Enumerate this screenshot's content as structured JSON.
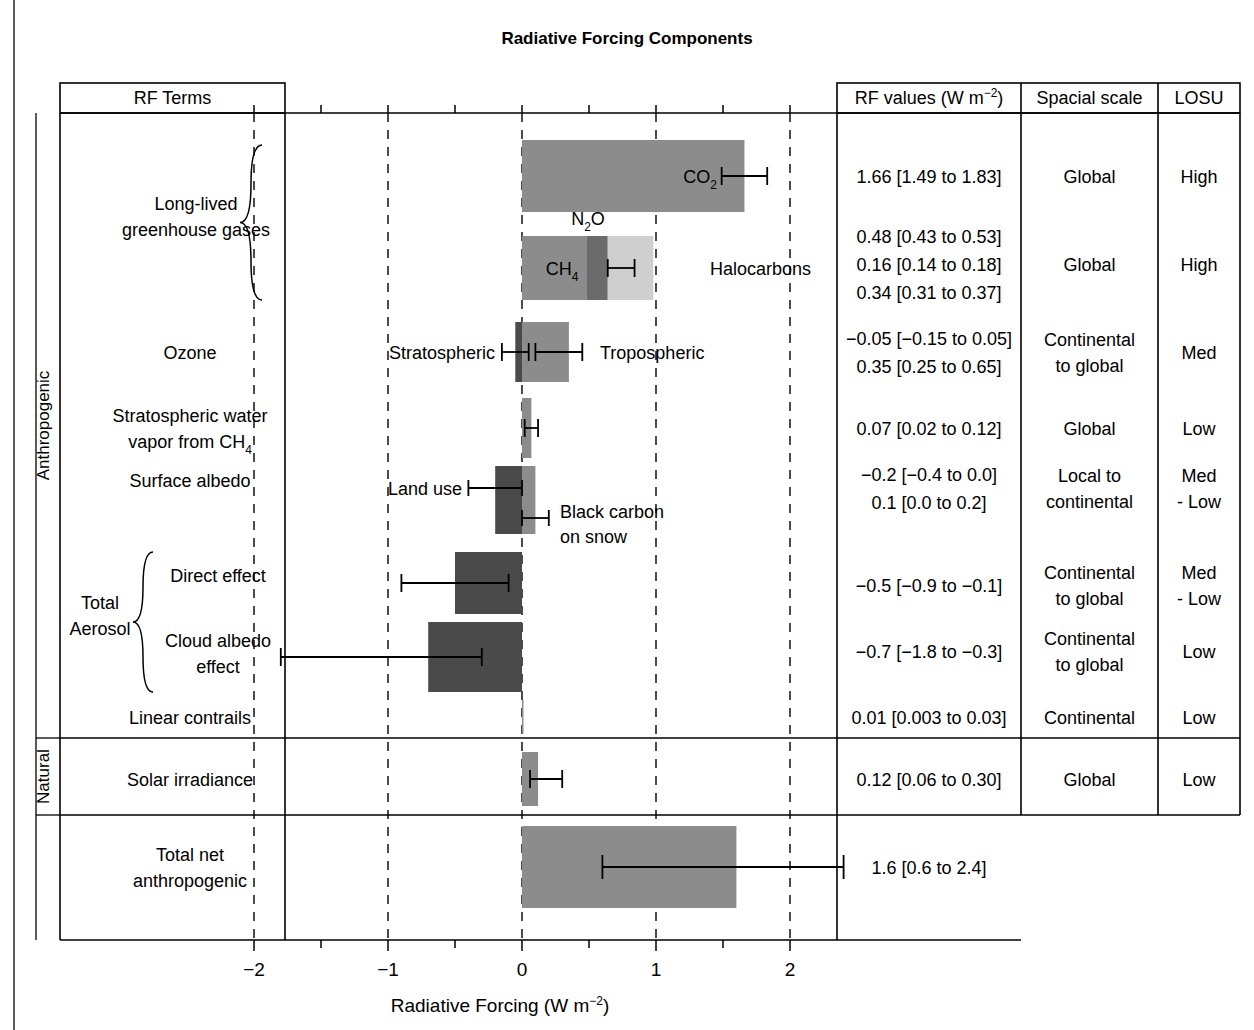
{
  "figure": {
    "title": "Radiative Forcing Components",
    "axis_label_pre": "Radiative Forcing (W m",
    "axis_label_sup": "−2",
    "axis_label_post": ")"
  },
  "table_headers": {
    "rf_terms": "RF Terms",
    "rf_values_pre": "RF values (W m",
    "rf_values_sup": "−2",
    "rf_values_post": ")",
    "spacial_scale": "Spacial scale",
    "losu": "LOSU"
  },
  "side_groups": [
    {
      "label": "Anthropogenic"
    },
    {
      "label": "Natural"
    }
  ],
  "group_braces": [
    {
      "label_line1": "Long-lived",
      "label_line2": "greenhouse gases"
    },
    {
      "label_line1": "Total",
      "label_line2": "Aerosol"
    }
  ],
  "rows": [
    {
      "name": "long-lived-greenhouse-gases-co2",
      "term_lines": [],
      "rf_values": [
        "1.66 [1.49 to 1.83]"
      ],
      "spacial_scale": [
        "Global"
      ],
      "losu": [
        "High"
      ]
    },
    {
      "name": "long-lived-greenhouse-gases-ch4-n2o-halocarbons",
      "term_lines": [],
      "rf_values": [
        "0.48 [0.43 to 0.53]",
        "0.16 [0.14 to 0.18]",
        "0.34 [0.31 to 0.37]"
      ],
      "spacial_scale": [
        "Global"
      ],
      "losu": [
        "High"
      ]
    },
    {
      "name": "ozone",
      "term_lines": [
        "Ozone"
      ],
      "rf_values": [
        "−0.05 [−0.15 to 0.05]",
        "0.35 [0.25 to 0.65]"
      ],
      "spacial_scale": [
        "Continental",
        "to global"
      ],
      "losu": [
        "Med"
      ]
    },
    {
      "name": "stratospheric-water-vapour",
      "term_lines": [
        "Stratospheric water",
        "vapor from  CH4"
      ],
      "rf_values": [
        "0.07 [0.02 to 0.12]"
      ],
      "spacial_scale": [
        "Global"
      ],
      "losu": [
        "Low"
      ]
    },
    {
      "name": "surface-albedo",
      "term_lines": [
        "Surface albedo"
      ],
      "rf_values": [
        "−0.2 [−0.4 to 0.0]",
        "0.1 [0.0 to 0.2]"
      ],
      "spacial_scale": [
        "Local to",
        "continental"
      ],
      "losu": [
        "Med",
        "- Low"
      ]
    },
    {
      "name": "total-aerosol-direct-effect",
      "term_lines": [
        "Direct effect"
      ],
      "rf_values": [
        "−0.5 [−0.9 to −0.1]"
      ],
      "spacial_scale": [
        "Continental",
        "to global"
      ],
      "losu": [
        "Med",
        "- Low"
      ]
    },
    {
      "name": "total-aerosol-cloud-albedo-effect",
      "term_lines": [
        "Cloud albedo",
        "effect"
      ],
      "rf_values": [
        "−0.7 [−1.8 to −0.3]"
      ],
      "spacial_scale": [
        "Continental",
        "to global"
      ],
      "losu": [
        "Low"
      ]
    },
    {
      "name": "linear-contrails",
      "term_lines": [
        "Linear contrails"
      ],
      "rf_values": [
        "0.01 [0.003 to 0.03]"
      ],
      "spacial_scale": [
        "Continental"
      ],
      "losu": [
        "Low"
      ]
    },
    {
      "name": "solar-irradiance",
      "term_lines": [
        "Solar irradiance"
      ],
      "rf_values": [
        "0.12 [0.06 to 0.30]"
      ],
      "spacial_scale": [
        "Global"
      ],
      "losu": [
        "Low"
      ]
    },
    {
      "name": "total-net-anthropogenic",
      "term_lines": [
        "Total net",
        "anthropogenic"
      ],
      "rf_values": [
        "1.6 [0.6 to 2.4]"
      ],
      "spacial_scale": [],
      "losu": []
    }
  ],
  "bar_annotations": {
    "co2": "CO2",
    "n2o": "N2O",
    "ch4": "CH4",
    "halocarbons": "Halocarbons",
    "stratospheric": "Stratospheric",
    "tropospheric": "Tropospheric",
    "land_use": "Land use",
    "black_carbon_l1": "Black carbon",
    "black_carbon_l2": "on snow"
  },
  "colors": {
    "bar_mid_gray": "#8c8c8c",
    "bar_dark_gray": "#6b6b6b",
    "bar_light_gray": "#cfcfcf",
    "bar_charcoal": "#4a4a4a",
    "line": "#000000",
    "background": "#ffffff"
  },
  "chart_data": {
    "type": "bar",
    "orientation": "horizontal",
    "title": "Radiative Forcing Components",
    "xlabel": "Radiative Forcing (W m−2)",
    "ylabel": "",
    "xlim": [
      -2.45,
      2.45
    ],
    "xticks": [
      -2,
      -1,
      0,
      1,
      2
    ],
    "xticklabels": [
      "−2",
      "−1",
      "0",
      "1",
      "2"
    ],
    "minor_xticks": [
      -1.5,
      -0.5,
      0.5,
      1.5
    ],
    "gridlines": [
      -2,
      -1,
      0,
      1,
      2
    ],
    "grid": true,
    "legend": "none",
    "units": "W m−2",
    "items": [
      {
        "label": "CO2",
        "value": 1.66,
        "low": 1.49,
        "high": 1.83,
        "color": "#8c8c8c",
        "category": "Long-lived greenhouse gases",
        "stack_start": 0.0
      },
      {
        "label": "CH4",
        "value": 0.48,
        "low": 0.43,
        "high": 0.53,
        "color": "#8c8c8c",
        "category": "Long-lived greenhouse gases",
        "stack_start": 0.0
      },
      {
        "label": "N2O",
        "value": 0.16,
        "low": 0.14,
        "high": 0.18,
        "color": "#6b6b6b",
        "category": "Long-lived greenhouse gases",
        "stack_start": 0.48
      },
      {
        "label": "Halocarbons",
        "value": 0.34,
        "low": 0.31,
        "high": 0.37,
        "color": "#cfcfcf",
        "category": "Long-lived greenhouse gases",
        "stack_start": 0.64
      },
      {
        "label": "Stratospheric ozone",
        "value": -0.05,
        "low": -0.15,
        "high": 0.05,
        "color": "#4a4a4a",
        "category": "Ozone",
        "stack_start": 0.0
      },
      {
        "label": "Tropospheric ozone",
        "value": 0.35,
        "low": 0.25,
        "high": 0.65,
        "color": "#8c8c8c",
        "category": "Ozone",
        "stack_start": 0.0
      },
      {
        "label": "Stratospheric water vapour from CH4",
        "value": 0.07,
        "low": 0.02,
        "high": 0.12,
        "color": "#8c8c8c",
        "category": "Stratospheric water vapor",
        "stack_start": 0.0
      },
      {
        "label": "Land use",
        "value": -0.2,
        "low": -0.4,
        "high": 0.0,
        "color": "#4a4a4a",
        "category": "Surface albedo",
        "stack_start": 0.0
      },
      {
        "label": "Black carbon on snow",
        "value": 0.1,
        "low": 0.0,
        "high": 0.2,
        "color": "#8c8c8c",
        "category": "Surface albedo",
        "stack_start": 0.0
      },
      {
        "label": "Direct effect",
        "value": -0.5,
        "low": -0.9,
        "high": -0.1,
        "color": "#4a4a4a",
        "category": "Total Aerosol",
        "stack_start": 0.0
      },
      {
        "label": "Cloud albedo effect",
        "value": -0.7,
        "low": -1.8,
        "high": -0.3,
        "color": "#4a4a4a",
        "category": "Total Aerosol",
        "stack_start": 0.0
      },
      {
        "label": "Linear contrails",
        "value": 0.01,
        "low": 0.003,
        "high": 0.03,
        "color": "#8c8c8c",
        "category": "Linear contrails",
        "stack_start": 0.0
      },
      {
        "label": "Solar irradiance",
        "value": 0.12,
        "low": 0.06,
        "high": 0.3,
        "color": "#8c8c8c",
        "category": "Natural",
        "stack_start": 0.0
      },
      {
        "label": "Total net anthropogenic",
        "value": 1.6,
        "low": 0.6,
        "high": 2.4,
        "color": "#8c8c8c",
        "category": "Total",
        "stack_start": 0.0
      }
    ]
  }
}
